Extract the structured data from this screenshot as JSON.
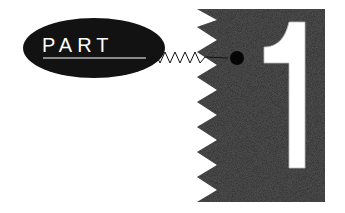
{
  "title": {
    "label": "PART",
    "number": "1"
  },
  "colors": {
    "ellipse": "#121212",
    "block": "#262626",
    "numeral_fill": "#ffffff",
    "background": "#ffffff"
  }
}
